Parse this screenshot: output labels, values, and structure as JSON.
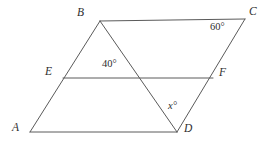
{
  "figure": {
    "kind": "geometry-diagram",
    "width": 269,
    "height": 145,
    "stroke_color": "#5a5a5a",
    "text_color": "#2e2e2e",
    "background_color": "#ffffff",
    "stroke_width": 1
  },
  "vertices": [
    {
      "id": "A",
      "label": "A",
      "x": 30,
      "y": 132
    },
    {
      "id": "B",
      "label": "B",
      "x": 100,
      "y": 21
    },
    {
      "id": "C",
      "label": "C",
      "x": 245,
      "y": 19
    },
    {
      "id": "D",
      "label": "D",
      "x": 177,
      "y": 132
    },
    {
      "id": "E",
      "label": "E",
      "x": 63,
      "y": 78
    },
    {
      "id": "F",
      "label": "F",
      "x": 213,
      "y": 78
    }
  ],
  "segments": [
    {
      "id": "AB",
      "from": "A",
      "to": "B"
    },
    {
      "id": "BC",
      "from": "B",
      "to": "C"
    },
    {
      "id": "CD",
      "from": "C",
      "to": "D"
    },
    {
      "id": "DA",
      "from": "D",
      "to": "A"
    },
    {
      "id": "EF",
      "from": "E",
      "to": "F"
    },
    {
      "id": "BD",
      "from": "B",
      "to": "D"
    }
  ],
  "angle_labels": [
    {
      "id": "angle-at-c",
      "text": "60°",
      "at_vertex": "C",
      "value": 60,
      "unknown": false
    },
    {
      "id": "angle-at-e",
      "text": "40°",
      "at_vertex": "E",
      "value": 40,
      "unknown": false
    },
    {
      "id": "angle-at-d",
      "text": "x°",
      "at_vertex": "D",
      "value": null,
      "unknown": true
    }
  ]
}
